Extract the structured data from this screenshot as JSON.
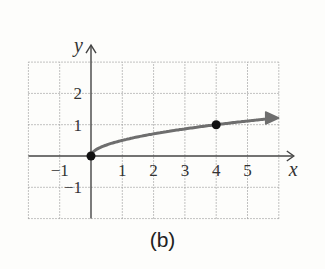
{
  "caption": "(b)",
  "chart_data": {
    "type": "line",
    "title": "",
    "caption": "(b)",
    "xlabel": "x",
    "ylabel": "y",
    "xlim": [
      -2,
      6
    ],
    "ylim": [
      -2,
      3
    ],
    "grid": true,
    "grid_style": "dotted",
    "x_ticks": [
      -1,
      1,
      2,
      3,
      4,
      5
    ],
    "y_ticks": [
      -1,
      1,
      2
    ],
    "x_tick_labels": [
      "−1",
      "1",
      "2",
      "3",
      "4",
      "5"
    ],
    "y_tick_labels": [
      "−1",
      "1",
      "2"
    ],
    "series": [
      {
        "name": "f(x) = √x / 2",
        "x": [
          0,
          0.25,
          0.5,
          1,
          2,
          3,
          4,
          5,
          6
        ],
        "y": [
          0,
          0.25,
          0.354,
          0.5,
          0.707,
          0.866,
          1.0,
          1.118,
          1.225
        ],
        "color": "#6e6e6e",
        "arrow_end": true
      }
    ],
    "highlighted_points": [
      {
        "x": 0,
        "y": 0
      },
      {
        "x": 4,
        "y": 1
      }
    ],
    "legend": null
  },
  "colors": {
    "axis": "#444444",
    "grid": "#9a9a9a",
    "curve": "#6e6e6e",
    "point": "#111111"
  }
}
